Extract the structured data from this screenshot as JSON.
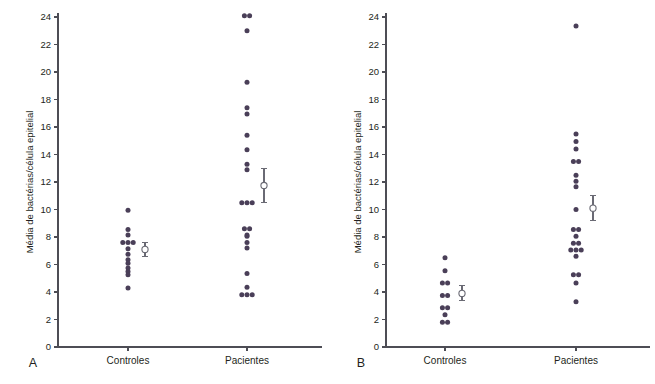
{
  "figure": {
    "axis_title": "Média de bactérias/célula epitelial",
    "dot_color": "#4a3f58",
    "axis_color": "#4d4d55",
    "errorbar_color": "#6a6a74"
  },
  "panels": [
    {
      "letter": "A",
      "categories": [
        "Controles",
        "Pacientes"
      ],
      "yticks": [
        "0",
        "2",
        "4",
        "6",
        "8",
        "10",
        "12",
        "14",
        "16",
        "18",
        "20",
        "22",
        "24"
      ]
    },
    {
      "letter": "B",
      "categories": [
        "Controles",
        "Pacientes"
      ],
      "yticks": [
        "0",
        "2",
        "4",
        "6",
        "8",
        "10",
        "12",
        "14",
        "16",
        "18",
        "20",
        "22",
        "24"
      ]
    }
  ],
  "chart_data": [
    {
      "type": "scatter",
      "panel": "A",
      "title": "",
      "xlabel": "",
      "ylabel": "Média de bactérias/célula epitelial",
      "ylim": [
        0,
        24
      ],
      "ytick_step": 2,
      "grid": false,
      "legend": "none",
      "categories": [
        "Controles",
        "Pacientes"
      ],
      "series": [
        {
          "name": "Controles",
          "values": [
            9.95,
            8.55,
            8.15,
            7.6,
            7.6,
            7.6,
            7.15,
            6.75,
            6.35,
            6.1,
            5.75,
            5.5,
            5.25,
            4.3
          ],
          "mean": 7.1,
          "sem_upper": 7.6,
          "sem_lower": 6.6
        },
        {
          "name": "Pacientes",
          "values": [
            24.1,
            24.1,
            23.0,
            19.25,
            17.4,
            16.95,
            15.4,
            14.35,
            13.3,
            12.9,
            10.5,
            10.5,
            10.5,
            8.6,
            8.6,
            8.15,
            8.05,
            7.6,
            7.2,
            5.35,
            4.35,
            3.8,
            3.8,
            3.8
          ],
          "mean": 11.75,
          "sem_upper": 13.0,
          "sem_lower": 10.5
        }
      ]
    },
    {
      "type": "scatter",
      "panel": "B",
      "title": "",
      "xlabel": "",
      "ylabel": "Média de bactérias/célula epitelial",
      "ylim": [
        0,
        24
      ],
      "ytick_step": 2,
      "grid": false,
      "legend": "none",
      "categories": [
        "Controles",
        "Pacientes"
      ],
      "series": [
        {
          "name": "Controles",
          "values": [
            6.5,
            5.55,
            4.65,
            4.65,
            3.75,
            3.75,
            2.85,
            2.85,
            2.35,
            1.8,
            1.8
          ],
          "mean": 3.9,
          "sem_upper": 4.45,
          "sem_lower": 3.35
        },
        {
          "name": "Pacientes",
          "values": [
            23.35,
            15.5,
            14.95,
            14.4,
            13.5,
            13.5,
            12.5,
            12.05,
            11.65,
            10.0,
            8.55,
            8.55,
            8.05,
            7.55,
            7.55,
            7.05,
            7.05,
            7.05,
            6.6,
            5.25,
            5.25,
            4.65,
            3.3
          ],
          "mean": 10.1,
          "sem_upper": 11.0,
          "sem_lower": 9.2
        }
      ]
    }
  ]
}
